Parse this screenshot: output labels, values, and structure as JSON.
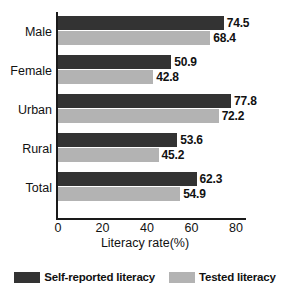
{
  "chart_data": {
    "type": "bar",
    "orientation": "horizontal",
    "title": "",
    "xlabel": "Literacy rate(%)",
    "ylabel": "",
    "xlim": [
      0,
      80
    ],
    "xticks": [
      0,
      20,
      40,
      60,
      80
    ],
    "grid": false,
    "legend_position": "bottom",
    "categories": [
      "Male",
      "Female",
      "Urban",
      "Rural",
      "Total"
    ],
    "series": [
      {
        "name": "Self-reported literacy",
        "color": "#333333",
        "values": [
          74.5,
          50.9,
          77.8,
          53.6,
          62.3
        ]
      },
      {
        "name": "Tested literacy",
        "color": "#b3b3b3",
        "values": [
          68.4,
          42.8,
          72.2,
          45.2,
          54.9
        ]
      }
    ],
    "value_labels": [
      [
        "74.5",
        "68.4"
      ],
      [
        "50.9",
        "42.8"
      ],
      [
        "77.8",
        "72.2"
      ],
      [
        "53.6",
        "45.2"
      ],
      [
        "62.3",
        "54.9"
      ]
    ],
    "xtick_labels": [
      "0",
      "20",
      "40",
      "60",
      "80"
    ]
  }
}
